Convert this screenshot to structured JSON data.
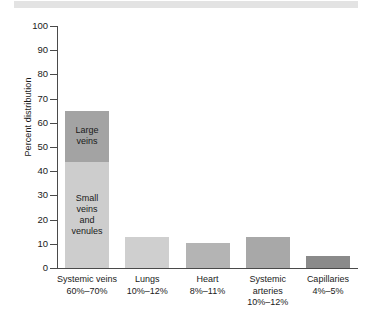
{
  "chart_data": {
    "type": "bar",
    "title": "",
    "subtitle": "",
    "xlabel": "",
    "ylabel": "Percent distribution",
    "ylim": [
      0,
      100
    ],
    "ytick_values": [
      100,
      90,
      80,
      70,
      60,
      50,
      40,
      30,
      20,
      10,
      0
    ],
    "ytick_labels": [
      "100",
      "90",
      "80",
      "70",
      "60",
      "50",
      "40",
      "30",
      "20",
      "10",
      "0"
    ],
    "grid": false,
    "legend": "none (segments labeled in place)",
    "stacked": true,
    "categories": [
      "Systemic veins",
      "Lungs",
      "Heart",
      "Systemic arteries",
      "Capillaries"
    ],
    "category_ranges": [
      "60%–70%",
      "10%–12%",
      "8%–11%",
      "10%–12%",
      "4%–5%"
    ],
    "values": [
      65,
      13,
      10.3,
      13,
      5
    ],
    "series": [
      {
        "name": "Small veins and venules",
        "values": [
          44,
          13,
          10.3,
          13,
          5
        ],
        "color": "#cdcdcd"
      },
      {
        "name": "Large veins",
        "values": [
          21,
          0,
          0,
          0,
          0
        ],
        "color": "#a3a3a3"
      }
    ],
    "segment_annotations": [
      {
        "text": "Large veins",
        "bar": "Systemic veins",
        "span": [
          44,
          65
        ]
      },
      {
        "text": "Small veins and venules",
        "bar": "Systemic veins",
        "span": [
          0,
          44
        ]
      }
    ],
    "bar_colors": [
      "#cdcdcd",
      "#cfcfcf",
      "#b4b4b4",
      "#a8a8a8",
      "#8a8a8a"
    ]
  },
  "bars": [
    {
      "name": "Systemic veins",
      "range": "60%–70%",
      "total": 65,
      "segments": [
        {
          "label": "Large veins",
          "from": 44,
          "to": 65,
          "color": "#a3a3a3"
        },
        {
          "label": "Small veins and venules",
          "from": 0,
          "to": 44,
          "color": "#cdcdcd"
        }
      ]
    },
    {
      "name": "Lungs",
      "range": "10%–12%",
      "total": 13,
      "segments": [
        {
          "label": "",
          "from": 0,
          "to": 13,
          "color": "#cfcfcf"
        }
      ]
    },
    {
      "name": "Heart",
      "range": "8%–11%",
      "total": 10.3,
      "segments": [
        {
          "label": "",
          "from": 0,
          "to": 10.3,
          "color": "#b4b4b4"
        }
      ]
    },
    {
      "name": "Systemic arteries",
      "range": "10%–12%",
      "total": 13,
      "segments": [
        {
          "label": "",
          "from": 0,
          "to": 13,
          "color": "#a8a8a8"
        }
      ]
    },
    {
      "name": "Capillaries",
      "range": "4%–5%",
      "total": 5,
      "segments": [
        {
          "label": "",
          "from": 0,
          "to": 5,
          "color": "#8a8a8a"
        }
      ]
    }
  ],
  "axis": {
    "y_title": "Percent distribution",
    "y_labels": [
      "100",
      "90",
      "80",
      "70",
      "60",
      "50",
      "40",
      "30",
      "20",
      "10",
      "0"
    ]
  },
  "segment_text": {
    "large_veins": "Large\nveins",
    "large_veins_line1": "Large",
    "large_veins_line2": "veins",
    "small_veins_line1": "Small",
    "small_veins_line2": "veins",
    "small_veins_line3": "and",
    "small_veins_line4": "venules"
  }
}
